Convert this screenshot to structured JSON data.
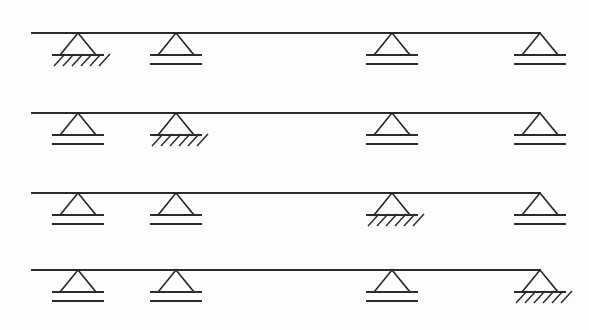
{
  "figure": {
    "background_color": "#fdfdfd",
    "line_color": "#2b2b2b",
    "width": 589,
    "height": 330
  },
  "legend": {
    "pinned_label": "pinned-support",
    "roller_label": "roller-support",
    "beam_label": "beam"
  },
  "geometry": {
    "support_x_positions": [
      78,
      176,
      392,
      540
    ],
    "beam_start_x": 32,
    "beam_end_x": 540,
    "beam_y_positions": [
      33,
      113,
      193,
      270
    ],
    "triangle_half_width": 18,
    "triangle_height": 22,
    "ground_line_half_width": 26,
    "roller_gap": 9,
    "hatch_count": 6,
    "hatch_length": 11,
    "hatch_spacing": 9
  },
  "beams": [
    {
      "id": "beam-1",
      "label": "Beam 1",
      "y": 33,
      "start_x": 32,
      "end_x": 540,
      "supports": [
        {
          "id": "b1-s1",
          "x": 78,
          "type": "pinned",
          "label": "Support A (pinned)"
        },
        {
          "id": "b1-s2",
          "x": 176,
          "type": "roller",
          "label": "Support B (roller)"
        },
        {
          "id": "b1-s3",
          "x": 392,
          "type": "roller",
          "label": "Support C (roller)"
        },
        {
          "id": "b1-s4",
          "x": 540,
          "type": "roller",
          "label": "Support D (roller)"
        }
      ]
    },
    {
      "id": "beam-2",
      "label": "Beam 2",
      "y": 113,
      "start_x": 32,
      "end_x": 540,
      "supports": [
        {
          "id": "b2-s1",
          "x": 78,
          "type": "roller",
          "label": "Support A (roller)"
        },
        {
          "id": "b2-s2",
          "x": 176,
          "type": "pinned",
          "label": "Support B (pinned)"
        },
        {
          "id": "b2-s3",
          "x": 392,
          "type": "roller",
          "label": "Support C (roller)"
        },
        {
          "id": "b2-s4",
          "x": 540,
          "type": "roller",
          "label": "Support D (roller)"
        }
      ]
    },
    {
      "id": "beam-3",
      "label": "Beam 3",
      "y": 193,
      "start_x": 32,
      "end_x": 540,
      "supports": [
        {
          "id": "b3-s1",
          "x": 78,
          "type": "roller",
          "label": "Support A (roller)"
        },
        {
          "id": "b3-s2",
          "x": 176,
          "type": "roller",
          "label": "Support B (roller)"
        },
        {
          "id": "b3-s3",
          "x": 392,
          "type": "pinned",
          "label": "Support C (pinned)"
        },
        {
          "id": "b3-s4",
          "x": 540,
          "type": "roller",
          "label": "Support D (roller)"
        }
      ]
    },
    {
      "id": "beam-4",
      "label": "Beam 4",
      "y": 270,
      "start_x": 32,
      "end_x": 540,
      "supports": [
        {
          "id": "b4-s1",
          "x": 78,
          "type": "roller",
          "label": "Support A (roller)"
        },
        {
          "id": "b4-s2",
          "x": 176,
          "type": "roller",
          "label": "Support B (roller)"
        },
        {
          "id": "b4-s3",
          "x": 392,
          "type": "roller",
          "label": "Support C (roller)"
        },
        {
          "id": "b4-s4",
          "x": 540,
          "type": "pinned",
          "label": "Support D (pinned)"
        }
      ]
    }
  ]
}
